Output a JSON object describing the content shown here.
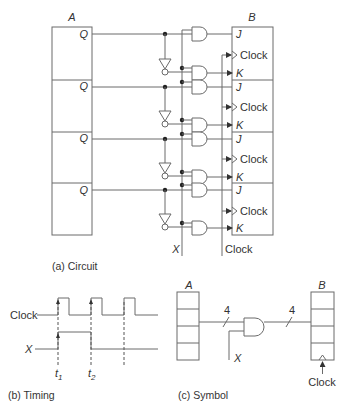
{
  "circuit": {
    "register_a_label": "A",
    "register_b_label": "B",
    "q_labels": [
      "Q",
      "Q",
      "Q",
      "Q"
    ],
    "stages": [
      {
        "j": "J",
        "clock": "Clock",
        "k": "K"
      },
      {
        "j": "J",
        "clock": "Clock",
        "k": "K"
      },
      {
        "j": "J",
        "clock": "Clock",
        "k": "K"
      },
      {
        "j": "J",
        "clock": "Clock",
        "k": "K"
      }
    ],
    "x_label": "X",
    "clock_label": "Clock",
    "caption": "(a)  Circuit"
  },
  "timing": {
    "clock_label": "Clock",
    "x_label": "X",
    "t1_label": "t",
    "t1_sub": "1",
    "t2_label": "t",
    "t2_sub": "2",
    "caption": "(b)  Timing"
  },
  "symbol": {
    "register_a_label": "A",
    "register_b_label": "B",
    "bus_width_in": "4",
    "bus_width_out": "4",
    "x_label": "X",
    "clock_label": "Clock",
    "caption": "(c)  Symbol"
  }
}
